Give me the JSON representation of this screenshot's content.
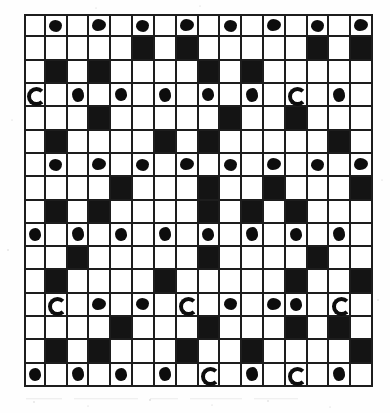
{
  "figure": {
    "kind": "scanned-grid-figure",
    "grid": {
      "rows": 16,
      "columns": 16,
      "cell_px": 21.8,
      "border_color": "#1d1d1d",
      "white_cell_color": "#ffffff",
      "black_cell_color": "#141414",
      "stone_color": "#0d0d0d",
      "outer_border_px": 3
    },
    "legend": {
      "black_cell_label": "filled cell",
      "white_cell_label": "empty cell",
      "stone_label": "inked stone"
    },
    "page_background": "#fefefe"
  },
  "chart_data": {
    "type": "heatmap",
    "title": "",
    "xlabel": "",
    "ylabel": "",
    "grid": true,
    "legend_position": "none",
    "rows": 16,
    "columns": 16,
    "value_encoding": {
      "0": "white cell",
      "1": "black cell",
      "2": "white cell with inked stone"
    },
    "matrix": [
      [
        0,
        2,
        0,
        2,
        0,
        2,
        0,
        2,
        0,
        2,
        0,
        2,
        0,
        2,
        0,
        2
      ],
      [
        0,
        0,
        0,
        0,
        0,
        1,
        0,
        1,
        0,
        0,
        0,
        0,
        0,
        1,
        0,
        1
      ],
      [
        0,
        1,
        0,
        1,
        0,
        0,
        0,
        0,
        1,
        0,
        1,
        0,
        0,
        0,
        0,
        0
      ],
      [
        2,
        0,
        2,
        0,
        2,
        0,
        2,
        0,
        2,
        0,
        2,
        0,
        2,
        0,
        2,
        0
      ],
      [
        0,
        0,
        0,
        1,
        0,
        0,
        0,
        0,
        0,
        1,
        0,
        0,
        1,
        0,
        0,
        0
      ],
      [
        0,
        1,
        0,
        0,
        0,
        0,
        1,
        0,
        1,
        0,
        0,
        0,
        0,
        0,
        1,
        0
      ],
      [
        0,
        2,
        0,
        2,
        0,
        2,
        0,
        2,
        0,
        2,
        0,
        2,
        0,
        2,
        0,
        2
      ],
      [
        0,
        0,
        0,
        0,
        1,
        0,
        0,
        0,
        1,
        0,
        0,
        1,
        0,
        0,
        0,
        1
      ],
      [
        0,
        1,
        0,
        1,
        0,
        0,
        0,
        0,
        1,
        0,
        1,
        0,
        1,
        0,
        0,
        0
      ],
      [
        2,
        0,
        2,
        0,
        2,
        0,
        2,
        0,
        2,
        0,
        2,
        0,
        2,
        0,
        2,
        0
      ],
      [
        0,
        0,
        1,
        0,
        0,
        0,
        0,
        0,
        1,
        0,
        0,
        0,
        0,
        1,
        0,
        0
      ],
      [
        0,
        1,
        0,
        0,
        0,
        0,
        1,
        0,
        0,
        0,
        0,
        0,
        1,
        0,
        0,
        1
      ],
      [
        0,
        2,
        0,
        2,
        0,
        2,
        0,
        2,
        0,
        2,
        0,
        2,
        2,
        0,
        2,
        0
      ],
      [
        0,
        0,
        0,
        0,
        1,
        0,
        0,
        0,
        1,
        0,
        0,
        0,
        1,
        0,
        1,
        0
      ],
      [
        0,
        1,
        0,
        1,
        0,
        0,
        0,
        1,
        0,
        0,
        1,
        0,
        0,
        0,
        0,
        1
      ],
      [
        2,
        0,
        2,
        0,
        2,
        0,
        2,
        0,
        2,
        0,
        2,
        0,
        2,
        0,
        2,
        0
      ]
    ],
    "row_labels": [
      "1",
      "2",
      "3",
      "4",
      "5",
      "6",
      "7",
      "8",
      "9",
      "10",
      "11",
      "12",
      "13",
      "14",
      "15",
      "16"
    ],
    "column_labels": [
      "1",
      "2",
      "3",
      "4",
      "5",
      "6",
      "7",
      "8",
      "9",
      "10",
      "11",
      "12",
      "13",
      "14",
      "15",
      "16"
    ]
  }
}
